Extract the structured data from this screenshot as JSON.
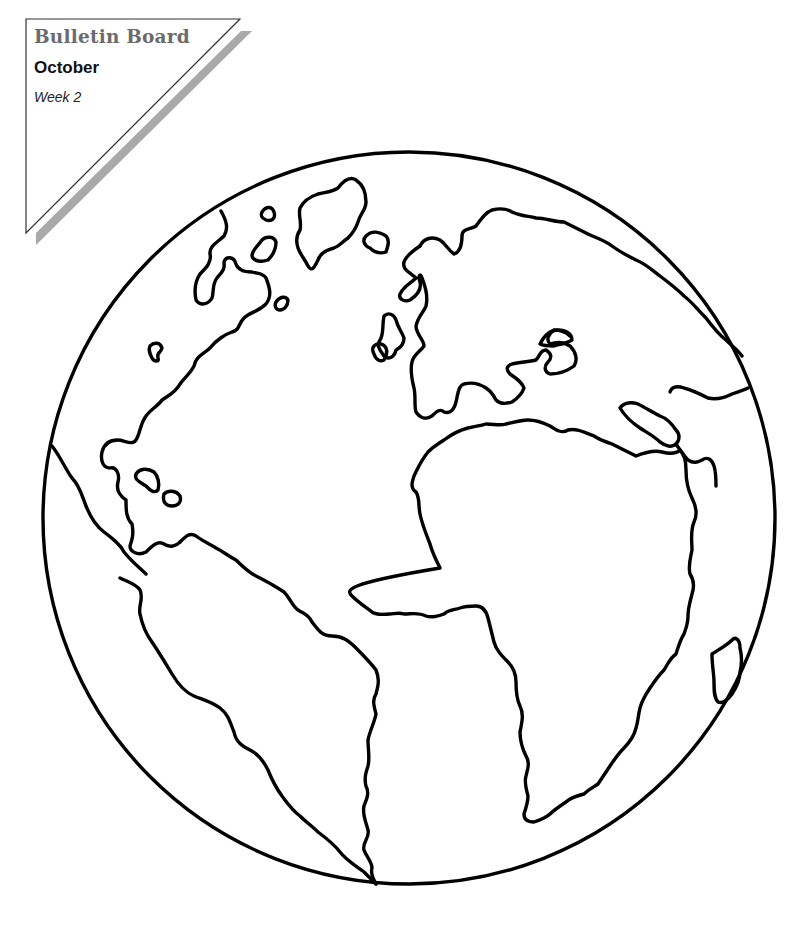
{
  "header": {
    "title": "Bulletin Board",
    "month": "October",
    "week": "Week 2"
  },
  "illustration": {
    "subject": "globe-coloring-page",
    "regions": [
      "north-america",
      "south-america",
      "greenland",
      "europe",
      "africa",
      "middle-east",
      "madagascar"
    ]
  },
  "colors": {
    "ink": "#000000",
    "title_gray": "#6b6b6b",
    "shadow_gray": "#a9a9a9",
    "paper": "#ffffff"
  }
}
